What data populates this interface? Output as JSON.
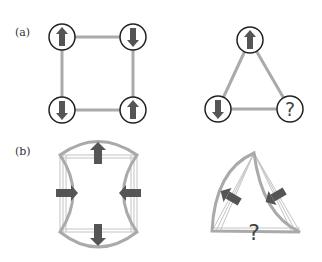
{
  "figure": {
    "colors": {
      "bond": "#aaaaaa",
      "bond_thin": "#bbbbbb",
      "arrow": "#555555",
      "circle_stroke": "#222222",
      "label": "#333333"
    },
    "panel_a": {
      "label": "(a)",
      "square": {
        "sites": [
          {
            "position": "top-left",
            "spin": "up"
          },
          {
            "position": "top-right",
            "spin": "down"
          },
          {
            "position": "bottom-left",
            "spin": "down"
          },
          {
            "position": "bottom-right",
            "spin": "up"
          }
        ]
      },
      "triangle": {
        "sites": [
          {
            "position": "top",
            "spin": "up"
          },
          {
            "position": "bottom-left",
            "spin": "down"
          },
          {
            "position": "bottom-right",
            "spin": "unknown",
            "symbol": "?"
          }
        ]
      }
    },
    "panel_b": {
      "label": "(b)",
      "square": {
        "description": "square lattice distorted by inward/outward forces",
        "arrows": [
          "up",
          "down",
          "right",
          "left"
        ]
      },
      "triangle": {
        "description": "triangle lattice distorted, frustrated",
        "arrows": [
          "up-left",
          "down-left"
        ],
        "symbol": "?"
      }
    }
  }
}
